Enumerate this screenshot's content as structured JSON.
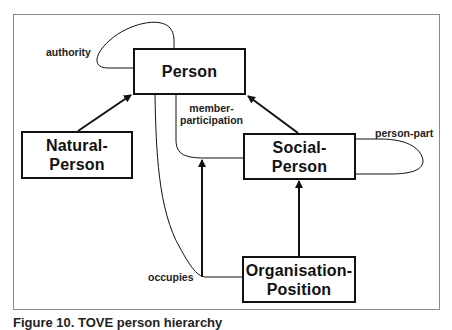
{
  "diagram": {
    "entities": [
      {
        "id": "person",
        "label": "Person"
      },
      {
        "id": "natural_person",
        "label": "Natural-\nPerson"
      },
      {
        "id": "social_person",
        "label": "Social-\nPerson"
      },
      {
        "id": "organisation_position",
        "label": "Organisation-\nPosition"
      }
    ],
    "relations": [
      {
        "label": "authority",
        "from": "Person",
        "to": "Person",
        "kind": "self-loop"
      },
      {
        "label": "member-\nparticipation",
        "from": "Person",
        "to": "Social-Person",
        "kind": "association"
      },
      {
        "label": "person-part",
        "from": "Social-Person",
        "to": "Social-Person",
        "kind": "self-loop"
      },
      {
        "label": "occupies",
        "from": "Person",
        "to": "Organisation-Position",
        "kind": "association"
      }
    ],
    "inheritance": [
      {
        "child": "Natural-Person",
        "parent": "Person"
      },
      {
        "child": "Social-Person",
        "parent": "Person"
      },
      {
        "child": "Organisation-Position",
        "parent": "Social-Person"
      },
      {
        "child": "occupies",
        "parent": "member-participation"
      }
    ],
    "caption": "Figure 10. TOVE person hierarchy"
  },
  "colors": {
    "line": "#111111",
    "frame": "#8a8a8a",
    "background": "#ffffff"
  }
}
